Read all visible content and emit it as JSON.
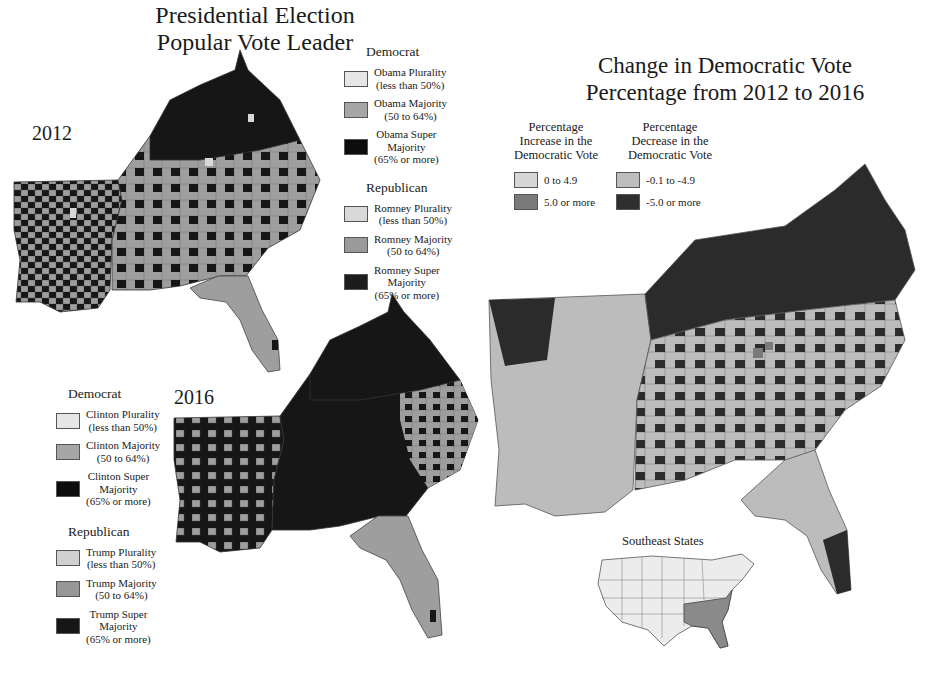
{
  "titles": {
    "popular_vote": [
      "Presidential Election",
      "Popular Vote Leader"
    ],
    "change": [
      "Change in Democratic Vote",
      "Percentage from 2012 to 2016"
    ]
  },
  "maps": {
    "map_2012": {
      "year_label": "2012"
    },
    "map_2016": {
      "year_label": "2016"
    },
    "inset": {
      "title": "Southeast States"
    }
  },
  "legend_2012": {
    "democrat": {
      "heading": "Democrat",
      "items": [
        {
          "label": [
            "Obama Plurality",
            "(less than 50%)"
          ],
          "color": "#e6e6e6"
        },
        {
          "label": [
            "Obama Majority",
            "(50 to 64%)"
          ],
          "color": "#a6a6a6"
        },
        {
          "label": [
            "Obama Super",
            "Majority",
            "(65% or more)"
          ],
          "color": "#0d0d0d"
        }
      ]
    },
    "republican": {
      "heading": "Republican",
      "items": [
        {
          "label": [
            "Romney Plurality",
            "(less than 50%)"
          ],
          "color": "#d9d9d9"
        },
        {
          "label": [
            "Romney Majority",
            "(50 to 64%)"
          ],
          "color": "#9a9a9a"
        },
        {
          "label": [
            "Romney Super",
            "Majority",
            "(65% or more)"
          ],
          "color": "#1c1c1c"
        }
      ]
    }
  },
  "legend_2016": {
    "democrat": {
      "heading": "Democrat",
      "items": [
        {
          "label": [
            "Clinton Plurality",
            "(less than 50%)"
          ],
          "color": "#e6e6e6"
        },
        {
          "label": [
            "Clinton Majority",
            "(50 to 64%)"
          ],
          "color": "#a6a6a6"
        },
        {
          "label": [
            "Clinton Super",
            "Majority",
            "(65% or more)"
          ],
          "color": "#0d0d0d"
        }
      ]
    },
    "republican": {
      "heading": "Republican",
      "items": [
        {
          "label": [
            "Trump Plurality",
            "(less than 50%)"
          ],
          "color": "#d0d0d0"
        },
        {
          "label": [
            "Trump Majority",
            "(50 to 64%)"
          ],
          "color": "#969696"
        },
        {
          "label": [
            "Trump Super",
            "Majority",
            "(65% or more)"
          ],
          "color": "#161616"
        }
      ]
    }
  },
  "legend_change": {
    "increase": {
      "heading": [
        "Percentage",
        "Increase in the",
        "Democratic Vote"
      ],
      "items": [
        {
          "label": "0 to 4.9",
          "color": "#d6d6d6"
        },
        {
          "label": "5.0 or more",
          "color": "#7a7a7a"
        }
      ]
    },
    "decrease": {
      "heading": [
        "Percentage",
        "Decrease in the",
        "Democratic Vote"
      ],
      "items": [
        {
          "label": "-0.1 to -4.9",
          "color": "#bdbdbd"
        },
        {
          "label": "-5.0 or more",
          "color": "#2e2e2e"
        }
      ]
    }
  },
  "colors": {
    "map_dark": "#161616",
    "map_mid": "#9e9e9e",
    "map_light": "#d8d8d8",
    "change_dark": "#2b2b2b",
    "change_light": "#bcbcbc",
    "inset_highlight": "#8a8a8a",
    "inset_base": "#ececec"
  }
}
